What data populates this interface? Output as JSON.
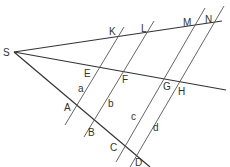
{
  "diagram": {
    "vertex": {
      "label": "S",
      "x": 14,
      "y": 52
    },
    "rays": [
      {
        "name": "top-ray",
        "x1": 14,
        "y1": 52,
        "x2": 222,
        "y2": 21
      },
      {
        "name": "middle-ray",
        "x1": 14,
        "y1": 52,
        "x2": 226,
        "y2": 90
      },
      {
        "name": "bottom-ray",
        "x1": 14,
        "y1": 52,
        "x2": 150,
        "y2": 167
      }
    ],
    "parallels": [
      {
        "name": "line-KEA",
        "x1": 124,
        "y1": 27,
        "x2": 65,
        "y2": 125
      },
      {
        "name": "line-LFB",
        "x1": 154,
        "y1": 21,
        "x2": 84,
        "y2": 137
      },
      {
        "name": "line-MGC",
        "x1": 205,
        "y1": 8,
        "x2": 116,
        "y2": 162
      },
      {
        "name": "line-NHD",
        "x1": 224,
        "y1": 6,
        "x2": 130,
        "y2": 167
      }
    ],
    "points": {
      "S": {
        "label": "S",
        "x": 3,
        "y": 56
      },
      "K": {
        "label": "K",
        "x": 109,
        "y": 35
      },
      "L": {
        "label": "L",
        "x": 141,
        "y": 32
      },
      "M": {
        "label": "M",
        "x": 183,
        "y": 26
      },
      "N": {
        "label": "N",
        "x": 205,
        "y": 23
      },
      "E": {
        "label": "E",
        "x": 84,
        "y": 77
      },
      "F": {
        "label": "F",
        "x": 122,
        "y": 83
      },
      "G": {
        "label": "G",
        "x": 163,
        "y": 90
      },
      "H": {
        "label": "H",
        "x": 178,
        "y": 95
      },
      "A": {
        "label": "A",
        "x": 64,
        "y": 111
      },
      "B": {
        "label": "B",
        "x": 88,
        "y": 136
      },
      "C": {
        "label": "C",
        "x": 110,
        "y": 151
      },
      "D": {
        "label": "D",
        "x": 135,
        "y": 166
      }
    },
    "segments": {
      "a": {
        "label": "a",
        "x": 78,
        "y": 92
      },
      "b": {
        "label": "b",
        "x": 108,
        "y": 107
      },
      "c": {
        "label": "c",
        "x": 131,
        "y": 120
      },
      "d": {
        "label": "d",
        "x": 153,
        "y": 131
      }
    },
    "colors": {
      "line": "#333333",
      "background": "#ffffff"
    }
  }
}
